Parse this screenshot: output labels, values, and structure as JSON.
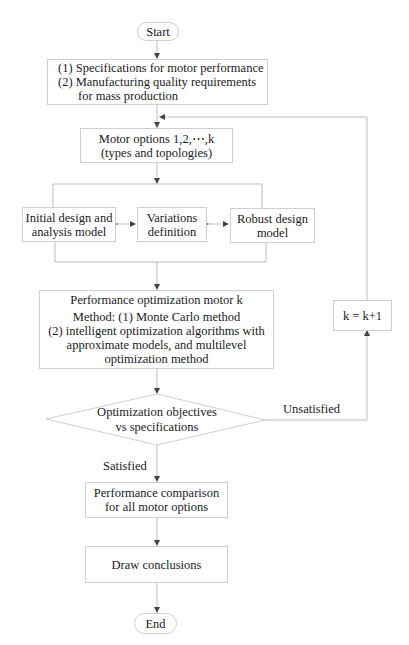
{
  "flowchart": {
    "start": "Start",
    "end": "End",
    "specs": {
      "lines": [
        "(1) Specifications for motor performance",
        "(2) Manufacturing quality requirements",
        "      for mass production"
      ]
    },
    "motor_options": {
      "lines": [
        "Motor options 1,2,⋯,k",
        "(types and topologies)"
      ]
    },
    "initial_design": {
      "lines": [
        "Initial design and",
        "analysis model"
      ]
    },
    "variations": {
      "lines": [
        "Variations",
        "definition"
      ]
    },
    "robust_design": {
      "lines": [
        "Robust design",
        "model"
      ]
    },
    "performance_optimization": {
      "lines": [
        "Performance optimization motor k",
        "Method: (1) Monte Carlo method",
        "(2) intelligent optimization algorithms with",
        "approximate models, and multilevel",
        "optimization method"
      ]
    },
    "decision": {
      "lines": [
        "Optimization objectives",
        "vs specifications"
      ]
    },
    "unsatisfied_label": "Unsatisfied",
    "satisfied_label": "Satisfied",
    "increment": "k = k+1",
    "comparison": {
      "lines": [
        "Performance comparison",
        "for all motor options"
      ]
    },
    "conclusions": "Draw conclusions"
  },
  "colors": {
    "line": "#bdbdbd",
    "border": "#cfcfcf",
    "text": "#1a1a1a"
  }
}
